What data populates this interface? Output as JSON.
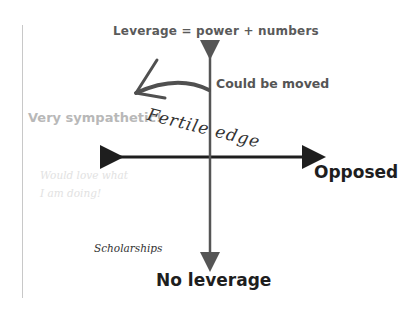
{
  "diagram": {
    "title_axis_top": "Leverage = power + numbers",
    "axis_bottom": "No leverage",
    "axis_right": "Opposed",
    "axis_left": "Very sympathetic!",
    "annotations": {
      "could_be_moved": "Could be moved",
      "fertile_edge": "Fertile edge",
      "would_love": [
        "Would love what",
        "I am doing!"
      ],
      "scholarships": "Scholarships"
    },
    "colors": {
      "axis": "#1e1e1e",
      "vertical_axis": "#555555",
      "faded_text": "#b8b8b8",
      "arrow": "#505050"
    }
  }
}
